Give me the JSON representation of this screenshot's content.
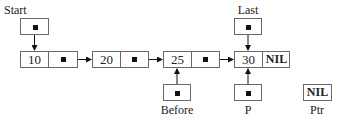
{
  "diagram": {
    "type": "singly-linked-list",
    "nodes": [
      {
        "id": "n10",
        "value": "10",
        "next": "n20"
      },
      {
        "id": "n20",
        "value": "20",
        "next": "n25"
      },
      {
        "id": "n25",
        "value": "25",
        "next": "n30"
      },
      {
        "id": "n30",
        "value": "30",
        "next": "NIL"
      }
    ],
    "pointers": [
      {
        "name": "Start",
        "label": "Start",
        "target": "n10"
      },
      {
        "name": "Last",
        "label": "Last",
        "target": "n30"
      },
      {
        "name": "Before",
        "label": "Before",
        "target": "n25"
      },
      {
        "name": "P",
        "label": "P",
        "target": "n30"
      },
      {
        "name": "Ptr",
        "label": "Ptr",
        "value": "NIL"
      }
    ],
    "nil_text": "NIL"
  }
}
